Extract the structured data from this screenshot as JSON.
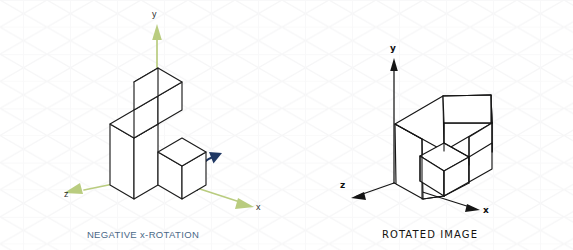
{
  "figure": {
    "background_color": "#ffffff",
    "grid": {
      "visible": true,
      "style": "isometric-triangular",
      "line_color": "#f7f7f8"
    },
    "panels": [
      {
        "id": "negative-x-rotation",
        "caption": "NEGATIVE x-ROTATION",
        "caption_color": "#4a6887",
        "line_style": "vector",
        "object_stroke_color": "#1c1c1c",
        "axes": {
          "color": "#b5c97a",
          "arrowhead_color": "#b9cc7f",
          "labels": {
            "x": "x",
            "y": "y",
            "z": "z"
          }
        },
        "rotation_arrow": {
          "present": true,
          "color": "#1f3864",
          "direction": "counterclockwise-about-x",
          "semantic": "rotation-arrow-icon"
        },
        "shape_description": "isometric stepped L-block: tall column, upper step cube, and lower front cube"
      },
      {
        "id": "rotated-image",
        "caption": "ROTATED IMAGE",
        "caption_color": "#14120f",
        "line_style": "hand-sketched",
        "object_stroke_color": "#151515",
        "axes": {
          "color": "#151515",
          "arrowhead_color": "#151515",
          "labels": {
            "x": "x",
            "y": "y",
            "z": "z"
          }
        },
        "rotation_arrow": {
          "present": false
        },
        "shape_description": "hand-drawn isometric notched block showing the solid after negative x-rotation"
      }
    ]
  }
}
